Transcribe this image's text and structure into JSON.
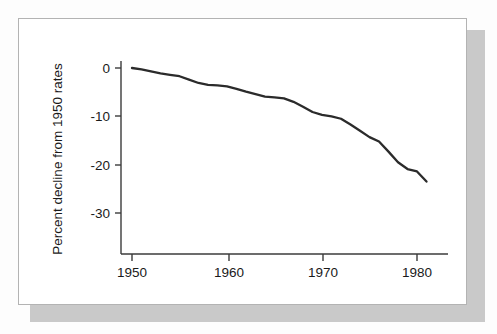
{
  "figure": {
    "frame_color": "#b3b3b3",
    "shadow_color": "#c9c9c9",
    "page_background": "#fdfdfd"
  },
  "chart_data": {
    "type": "line",
    "title": "",
    "subtitle": "",
    "xlabel": "",
    "ylabel": "Percent decline from 1950 rates",
    "xlim": [
      1950,
      1982
    ],
    "ylim": [
      -35,
      2
    ],
    "xticks": [
      1950,
      1960,
      1970,
      1980
    ],
    "xtick_labels": [
      "1950",
      "1960",
      "1970",
      "1980"
    ],
    "yticks": [
      0,
      -10,
      -20,
      -30
    ],
    "ytick_labels": [
      "0",
      "-10",
      "-20",
      "-30"
    ],
    "grid": false,
    "legend": null,
    "legend_position": "none",
    "line_color": "#2b2b2b",
    "series": [
      {
        "name": "Percent decline from 1950 rates",
        "x": [
          1950,
          1951,
          1952,
          1953,
          1954,
          1955,
          1956,
          1957,
          1958,
          1959,
          1960,
          1961,
          1962,
          1963,
          1964,
          1965,
          1966,
          1967,
          1968,
          1969,
          1970,
          1971,
          1972,
          1973,
          1974,
          1975,
          1976,
          1977,
          1978,
          1979,
          1980,
          1981
        ],
        "values": [
          0.0,
          -0.3,
          -0.7,
          -1.1,
          -1.4,
          -1.7,
          -2.4,
          -3.1,
          -3.5,
          -3.6,
          -3.8,
          -4.3,
          -4.9,
          -5.4,
          -5.9,
          -6.1,
          -6.3,
          -7.0,
          -8.0,
          -9.1,
          -9.7,
          -10.0,
          -10.5,
          -11.7,
          -13.0,
          -14.3,
          -15.2,
          -17.3,
          -19.5,
          -20.9,
          -21.4,
          -23.5
        ]
      }
    ],
    "annotations": []
  }
}
